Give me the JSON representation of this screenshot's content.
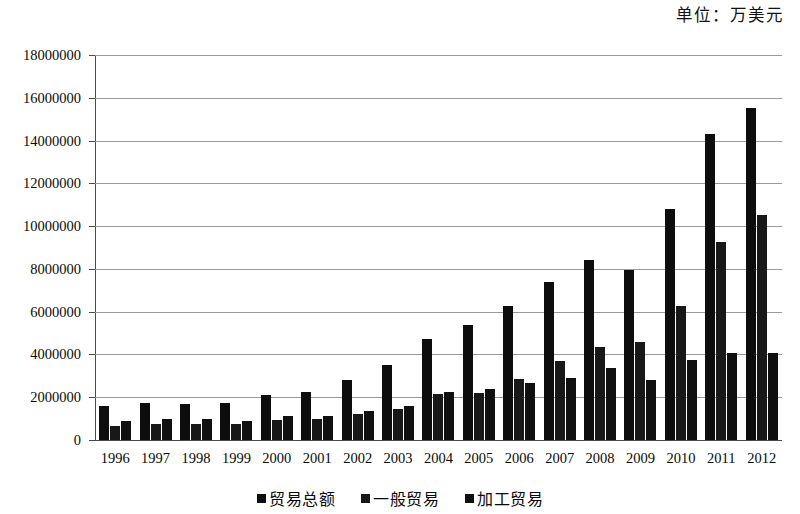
{
  "unit_caption": "单位：万美元",
  "legend": {
    "position": "bottom-center",
    "items": [
      {
        "label": "贸易总额",
        "color": "#0d0d0d"
      },
      {
        "label": "一般贸易",
        "color": "#181818"
      },
      {
        "label": "加工贸易",
        "color": "#101010"
      }
    ]
  },
  "axis": {
    "y_ticks": [
      "18000000",
      "16000000",
      "14000000",
      "12000000",
      "10000000",
      "8000000",
      "6000000",
      "4000000",
      "2000000",
      "0"
    ]
  },
  "chart_data": {
    "type": "bar",
    "title": "",
    "subtitle": "",
    "annotations": [
      "单位：万美元"
    ],
    "xlabel": "",
    "ylabel": "",
    "ylim": [
      0,
      18000000
    ],
    "ytick_step": 2000000,
    "grid": true,
    "legend_position": "bottom-center",
    "categories": [
      "1996",
      "1997",
      "1998",
      "1999",
      "2000",
      "2001",
      "2002",
      "2003",
      "2004",
      "2005",
      "2006",
      "2007",
      "2008",
      "2009",
      "2010",
      "2011",
      "2012"
    ],
    "series": [
      {
        "name": "贸易总额",
        "color": "#0d0d0d",
        "values": [
          1580000,
          1740000,
          1680000,
          1720000,
          2100000,
          2250000,
          2800000,
          3500000,
          4700000,
          5400000,
          6250000,
          7400000,
          8400000,
          7950000,
          10800000,
          14300000,
          15500000
        ]
      },
      {
        "name": "一般贸易",
        "color": "#181818",
        "values": [
          660000,
          770000,
          760000,
          770000,
          950000,
          1000000,
          1200000,
          1450000,
          2150000,
          2200000,
          2850000,
          3700000,
          4350000,
          4600000,
          6250000,
          9250000,
          10500000
        ]
      },
      {
        "name": "加工贸易",
        "color": "#101010",
        "values": [
          870000,
          960000,
          960000,
          880000,
          1100000,
          1100000,
          1350000,
          1600000,
          2250000,
          2400000,
          2650000,
          2900000,
          3350000,
          2800000,
          3750000,
          4050000,
          4050000
        ]
      }
    ]
  }
}
